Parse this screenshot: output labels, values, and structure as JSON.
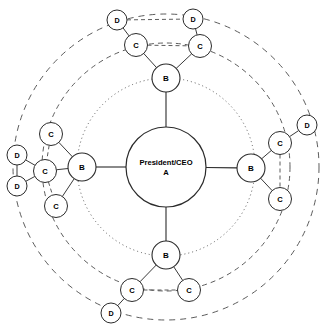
{
  "diagram": {
    "center": {
      "id": "center-node",
      "label_line1": "President/CEO",
      "label_line2": "A",
      "cx": 166,
      "cy": 167,
      "r": 40,
      "tier": "A"
    },
    "rings": [
      {
        "name": "inner-ring-b",
        "r": 89,
        "style": "dotted",
        "tier": "B"
      },
      {
        "name": "middle-ring-c",
        "r": 124,
        "style": "dashed",
        "tier": "C"
      },
      {
        "name": "outer-ring-d",
        "r": 153,
        "style": "dashed",
        "tier": "D"
      }
    ],
    "tier_radii": {
      "a": 40,
      "b": 14,
      "c": 11.5,
      "d": 10
    },
    "nodes": [
      {
        "id": "b-top",
        "label": "B",
        "tier": "B",
        "cx": 166,
        "cy": 78,
        "r": 14
      },
      {
        "id": "b-left",
        "label": "B",
        "tier": "B",
        "cx": 82,
        "cy": 167,
        "r": 14
      },
      {
        "id": "b-right",
        "label": "B",
        "tier": "B",
        "cx": 251,
        "cy": 168,
        "r": 14
      },
      {
        "id": "b-bottom",
        "label": "B",
        "tier": "B",
        "cx": 166,
        "cy": 255,
        "r": 14
      },
      {
        "id": "c-top-left",
        "label": "C",
        "tier": "C",
        "cx": 136,
        "cy": 45,
        "r": 11.5
      },
      {
        "id": "c-top-right",
        "label": "C",
        "tier": "C",
        "cx": 200,
        "cy": 46,
        "r": 11.5
      },
      {
        "id": "c-left-upper",
        "label": "C",
        "tier": "C",
        "cx": 51,
        "cy": 134,
        "r": 11.5
      },
      {
        "id": "c-left-mid",
        "label": "C",
        "tier": "C",
        "cx": 45,
        "cy": 171,
        "r": 11.5
      },
      {
        "id": "c-left-lower",
        "label": "C",
        "tier": "C",
        "cx": 56,
        "cy": 206,
        "r": 11.5
      },
      {
        "id": "c-right-upper",
        "label": "C",
        "tier": "C",
        "cx": 280,
        "cy": 143,
        "r": 11.5
      },
      {
        "id": "c-right-lower",
        "label": "C",
        "tier": "C",
        "cx": 280,
        "cy": 199,
        "r": 11.5
      },
      {
        "id": "c-bottom-left",
        "label": "C",
        "tier": "C",
        "cx": 132,
        "cy": 290,
        "r": 11.5
      },
      {
        "id": "c-bottom-right",
        "label": "C",
        "tier": "C",
        "cx": 189,
        "cy": 290,
        "r": 11.5
      },
      {
        "id": "d-top-left",
        "label": "D",
        "tier": "D",
        "cx": 117,
        "cy": 20,
        "r": 10
      },
      {
        "id": "d-top-right",
        "label": "D",
        "tier": "D",
        "cx": 193,
        "cy": 19,
        "r": 10
      },
      {
        "id": "d-left-upper",
        "label": "D",
        "tier": "D",
        "cx": 17,
        "cy": 155,
        "r": 10
      },
      {
        "id": "d-left-lower",
        "label": "D",
        "tier": "D",
        "cx": 17,
        "cy": 186,
        "r": 10
      },
      {
        "id": "d-right",
        "label": "D",
        "tier": "D",
        "cx": 307,
        "cy": 125,
        "r": 10
      },
      {
        "id": "d-bottom",
        "label": "D",
        "tier": "D",
        "cx": 111,
        "cy": 313,
        "r": 10
      }
    ],
    "edges": [
      {
        "from": "center-node",
        "to": "b-top",
        "style": "solid"
      },
      {
        "from": "center-node",
        "to": "b-left",
        "style": "solid"
      },
      {
        "from": "center-node",
        "to": "b-right",
        "style": "solid"
      },
      {
        "from": "center-node",
        "to": "b-bottom",
        "style": "solid"
      },
      {
        "from": "b-top",
        "to": "c-top-left",
        "style": "solid"
      },
      {
        "from": "b-top",
        "to": "c-top-right",
        "style": "solid"
      },
      {
        "from": "c-top-left",
        "to": "c-top-right",
        "style": "dashed"
      },
      {
        "from": "c-top-left",
        "to": "d-top-left",
        "style": "solid"
      },
      {
        "from": "c-top-right",
        "to": "d-top-right",
        "style": "solid"
      },
      {
        "from": "d-top-left",
        "to": "d-top-right",
        "style": "dashed"
      },
      {
        "from": "b-left",
        "to": "c-left-upper",
        "style": "solid"
      },
      {
        "from": "b-left",
        "to": "c-left-mid",
        "style": "solid"
      },
      {
        "from": "b-left",
        "to": "c-left-lower",
        "style": "solid"
      },
      {
        "from": "c-left-upper",
        "to": "c-left-mid",
        "style": "dashed"
      },
      {
        "from": "c-left-mid",
        "to": "c-left-lower",
        "style": "dashed"
      },
      {
        "from": "c-left-mid",
        "to": "d-left-upper",
        "style": "solid"
      },
      {
        "from": "c-left-mid",
        "to": "d-left-lower",
        "style": "solid"
      },
      {
        "from": "d-left-upper",
        "to": "d-left-lower",
        "style": "solid"
      },
      {
        "from": "b-right",
        "to": "c-right-upper",
        "style": "solid"
      },
      {
        "from": "b-right",
        "to": "c-right-lower",
        "style": "solid"
      },
      {
        "from": "c-right-upper",
        "to": "c-right-lower",
        "style": "dashed"
      },
      {
        "from": "c-right-upper",
        "to": "d-right",
        "style": "solid"
      },
      {
        "from": "b-bottom",
        "to": "c-bottom-left",
        "style": "solid"
      },
      {
        "from": "b-bottom",
        "to": "c-bottom-right",
        "style": "solid"
      },
      {
        "from": "c-bottom-left",
        "to": "c-bottom-right",
        "style": "dashed"
      },
      {
        "from": "c-bottom-left",
        "to": "d-bottom",
        "style": "solid"
      }
    ],
    "colors": {
      "background": "#ffffff",
      "node_fill": "#ffffff",
      "node_stroke": "#2b2b2b",
      "ring_stroke": "#4a4a4a",
      "label": "#000000"
    }
  }
}
